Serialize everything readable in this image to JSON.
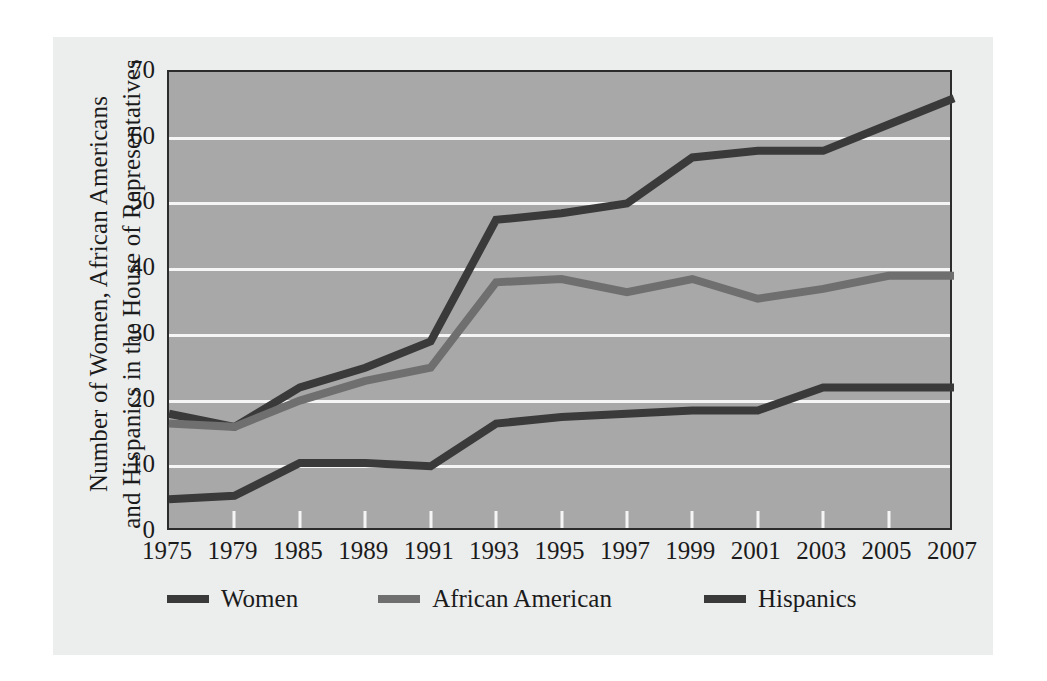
{
  "chart_data": {
    "type": "line",
    "title": "",
    "ylabel": "Number of Women, African Americans and Hispanics in the House of Representatives",
    "ylabel_line1": "Number of Women, African Americans",
    "ylabel_line2": "and Hispanics in the House of Representatives",
    "xlabel": "",
    "categories": [
      "1975",
      "1979",
      "1985",
      "1989",
      "1991",
      "1993",
      "1995",
      "1997",
      "1999",
      "2001",
      "2003",
      "2005",
      "2007"
    ],
    "ylim": [
      0,
      70
    ],
    "y_ticks": [
      "0",
      "10",
      "20",
      "30",
      "40",
      "50",
      "60",
      "70"
    ],
    "grid": "horizontal-white",
    "legend_position": "bottom-left",
    "series": [
      {
        "name": "Women",
        "color": "#3a3a3a",
        "values": [
          18,
          16,
          22,
          25,
          29,
          47.5,
          48.5,
          50,
          57,
          58,
          58,
          62,
          66
        ]
      },
      {
        "name": "African American",
        "color": "#6f6f6f",
        "values": [
          16.5,
          16,
          20,
          23,
          25,
          38,
          38.5,
          36.5,
          38.5,
          35.5,
          37,
          39,
          39
        ]
      },
      {
        "name": "Hispanics",
        "color": "#3a3a3a",
        "values": [
          5,
          5.5,
          10.5,
          10.5,
          10,
          16.5,
          17.5,
          18,
          18.5,
          18.5,
          22,
          22,
          22
        ]
      }
    ]
  },
  "legend": {
    "entries": [
      {
        "label": "Women",
        "swatch_color": "#3a3a3a"
      },
      {
        "label": "African American",
        "swatch_color": "#6f6f6f"
      },
      {
        "label": "Hispanics",
        "swatch_color": "#3a3a3a"
      }
    ]
  },
  "colors": {
    "page_background": "#ffffff",
    "panel_background": "#eceded",
    "plot_background": "#a8a8a8",
    "plot_border": "#2c2c2c",
    "gridline": "#f5f5f5",
    "text": "#1b1b1b"
  }
}
